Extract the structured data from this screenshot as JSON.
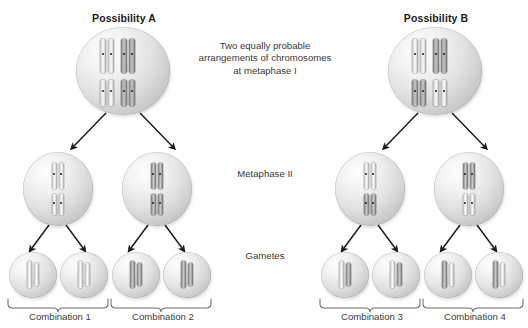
{
  "figure": {
    "title_a": "Possibility A",
    "title_b": "Possibility B",
    "center_note": "Two equally probable arrangements of chromosomes at metaphase I",
    "stage_labels": {
      "metaphase_two": "Metaphase II",
      "gametes": "Gametes"
    },
    "combinations": [
      {
        "label": "Combination 1"
      },
      {
        "label": "Combination 2"
      },
      {
        "label": "Combination 3"
      },
      {
        "label": "Combination 4"
      }
    ],
    "colors": {
      "background": "#ffffff",
      "text": "#3a3a3a",
      "title_text": "#1b1b1b",
      "cell_fill_light": "#fdfdfd",
      "cell_fill_shadow": "#a8a8a8",
      "chromosome_light": "#ededed",
      "chromosome_dark": "#8f8f8f",
      "centromere": "#1d1d1d",
      "arrow": "#1a1a1a",
      "bracket": "#6f6f6f"
    }
  }
}
